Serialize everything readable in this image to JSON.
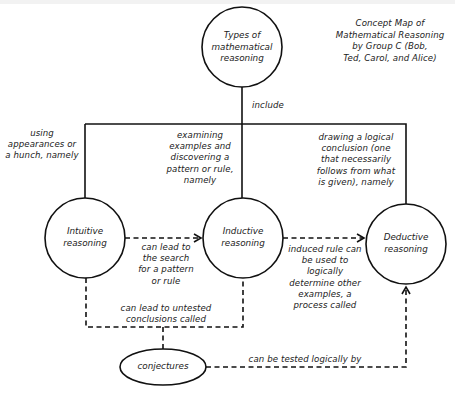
{
  "title": {
    "text": "Concept Map of\nMathematical Reasoning\nby Group C (Bob,\nTed, Carol, and Alice)"
  },
  "nodes": {
    "root": {
      "label": "Types of\nmathematical\nreasoning"
    },
    "intuitive": {
      "label": "Intuitive\nreasoning"
    },
    "inductive": {
      "label": "Inductive\nreasoning"
    },
    "deductive": {
      "label": "Deductive\nreasoning"
    },
    "conjectures": {
      "label": "conjectures"
    }
  },
  "links": {
    "include": "include",
    "intuitive_desc": "using\nappearances or\na hunch, namely",
    "inductive_desc": "examining\nexamples and\ndiscovering a\npattern or rule,\nnamely",
    "deductive_desc": "drawing a logical\nconclusion (one\nthat necessarily\nfollows from what\nis given), namely",
    "intuitive_to_inductive": "can lead to\nthe search\nfor a pattern\nor rule",
    "inductive_to_deductive": "induced rule can\nbe used to\nlogically\ndetermine other\nexamples, a\nprocess called",
    "to_conjectures": "can lead to untested\nconclusions called",
    "conjectures_to_deductive": "can be tested logically by"
  },
  "colors": {
    "stroke": "#111111",
    "text": "#222222",
    "background": "#ffffff"
  }
}
